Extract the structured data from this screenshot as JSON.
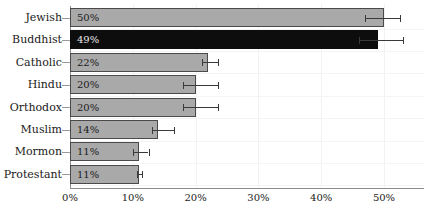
{
  "chart_data": {
    "type": "bar",
    "orientation": "horizontal",
    "title": "",
    "xlabel": "",
    "ylabel": "",
    "xlim": [
      0,
      55
    ],
    "grid": true,
    "legend": "none",
    "xticks": [
      "0%",
      "10%",
      "20%",
      "30%",
      "40%",
      "50%"
    ],
    "xtick_values": [
      0,
      10,
      20,
      30,
      40,
      50
    ],
    "categories": [
      "Jewish",
      "Buddhist",
      "Catholic",
      "Hindu",
      "Orthodox",
      "Muslim",
      "Mormon",
      "Protestant"
    ],
    "values": [
      50,
      49,
      22,
      20,
      20,
      14,
      11,
      11
    ],
    "value_labels": [
      "50%",
      "49%",
      "22%",
      "20%",
      "20%",
      "14%",
      "11%",
      "11%"
    ],
    "error_low": [
      47,
      46,
      21,
      18,
      18,
      13,
      10,
      10.6
    ],
    "error_high": [
      52.5,
      53,
      23.5,
      23.5,
      23.5,
      16.5,
      12.5,
      11.4
    ],
    "highlight_index": 1,
    "colors": {
      "bar_fill": "#a9a9a9",
      "bar_border": "#4a4a4a",
      "highlight_fill": "#0d0d0d",
      "highlight_text": "#e8e8e8",
      "label_text": "#1a1a1a",
      "grid": "#f2f2f2",
      "axis": "#8d8d8d",
      "error_bar": "#3a3a3a"
    }
  }
}
